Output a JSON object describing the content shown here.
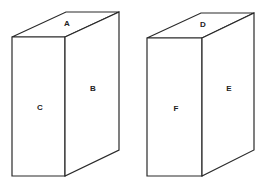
{
  "diagram": {
    "boxes": [
      {
        "id": "left-box",
        "faces": {
          "top": {
            "label": "A",
            "x": 67,
            "y": 24
          },
          "side": {
            "label": "B",
            "x": 93,
            "y": 89
          },
          "front": {
            "label": "C",
            "x": 40,
            "y": 108
          }
        },
        "points": {
          "top": "12,37 65,37 119,12 66,12",
          "front": "12,37 65,37 65,176 12,176",
          "side": "65,37 119,12 119,150 65,176"
        }
      },
      {
        "id": "right-box",
        "faces": {
          "top": {
            "label": "D",
            "x": 203,
            "y": 25
          },
          "side": {
            "label": "E",
            "x": 229,
            "y": 89
          },
          "front": {
            "label": "F",
            "x": 176,
            "y": 109
          }
        },
        "points": {
          "top": "147,38 202,38 254,13 201,13",
          "front": "147,38 202,38 202,176 147,176",
          "side": "202,38 254,13 254,150 202,176"
        }
      }
    ],
    "colors": {
      "stroke": "#2a2a2a",
      "background": "#ffffff",
      "text": "#222222"
    }
  }
}
